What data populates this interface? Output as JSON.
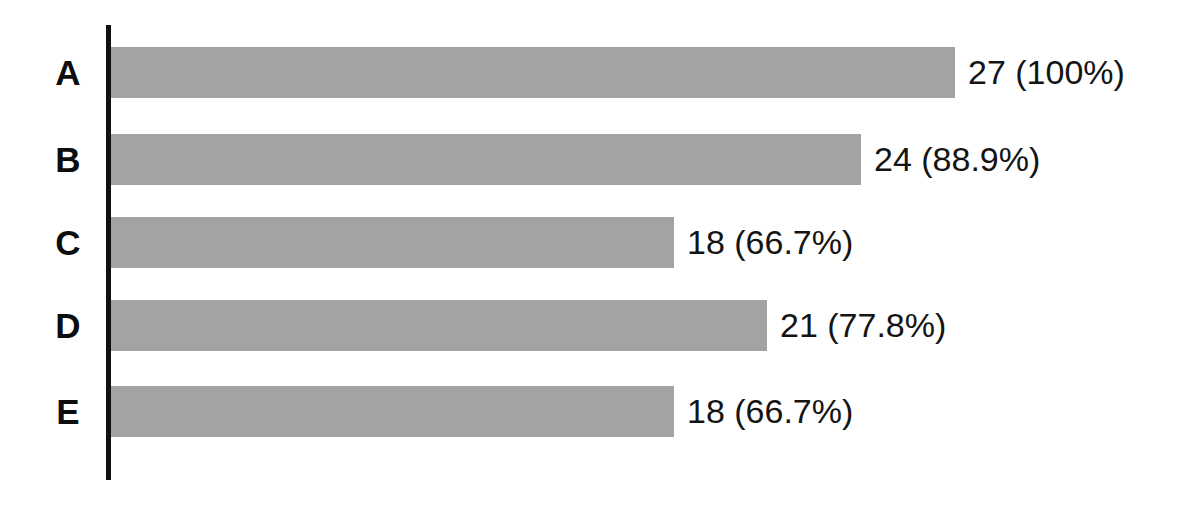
{
  "figure": {
    "background_color": "#ffffff",
    "axis_color": "#111111",
    "bar_color": "#a3a3a3",
    "label_color": "#0d0d0d",
    "value_color": "#141414"
  },
  "chart_data": {
    "type": "bar",
    "orientation": "horizontal",
    "title": "",
    "subtitle": "",
    "xlabel": "",
    "ylabel": "",
    "grid": false,
    "legend": false,
    "legend_position": "none",
    "xlim": [
      0,
      27
    ],
    "reference_total": 27,
    "categories": [
      "A",
      "B",
      "C",
      "D",
      "E"
    ],
    "values": [
      27,
      24,
      18,
      21,
      18
    ],
    "percents": [
      100,
      88.9,
      66.7,
      77.8,
      66.7
    ],
    "tick_labels": [
      "A",
      "B",
      "C",
      "D",
      "E"
    ],
    "annotations": [
      "27 (100%)",
      "24 (88.9%)",
      "18 (66.7%)",
      "21 (77.8%)",
      "18 (66.7%)"
    ],
    "bars": [
      {
        "category": "A",
        "value": 27,
        "percent": 100,
        "data_label": "27 (100%)"
      },
      {
        "category": "B",
        "value": 24,
        "percent": 88.9,
        "data_label": "24 (88.9%)"
      },
      {
        "category": "C",
        "value": 18,
        "percent": 66.7,
        "data_label": "18 (66.7%)"
      },
      {
        "category": "D",
        "value": 21,
        "percent": 77.8,
        "data_label": "21 (77.8%)"
      },
      {
        "category": "E",
        "value": 18,
        "percent": 66.7,
        "data_label": "18 (66.7%)"
      }
    ]
  }
}
